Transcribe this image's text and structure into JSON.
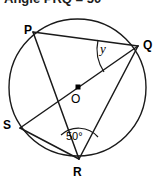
{
  "heading": {
    "text": "Angle PRQ = 50°"
  },
  "figure": {
    "caption_hidden": "Circle with inscribed points P, Q, R, S and centre O",
    "stroke_color": "#1a1a1a",
    "background_color": "#ffffff",
    "circle": {
      "cx": 77.5,
      "cy": 87.5,
      "r": 68.5
    },
    "centre": {
      "label": "O",
      "marker": "square-dot",
      "x": 78,
      "y": 87
    },
    "points": [
      {
        "id": "P",
        "label": "P",
        "x": 33,
        "y": 32
      },
      {
        "id": "Q",
        "label": "Q",
        "x": 138,
        "y": 46
      },
      {
        "id": "S",
        "label": "S",
        "x": 20,
        "y": 128
      },
      {
        "id": "R",
        "label": "R",
        "x": 79,
        "y": 159
      }
    ],
    "chords": [
      {
        "name": "PQ",
        "from": "P",
        "to": "Q"
      },
      {
        "name": "PR",
        "from": "P",
        "to": "R"
      },
      {
        "name": "QR",
        "from": "Q",
        "to": "R"
      },
      {
        "name": "SR",
        "from": "S",
        "to": "R"
      },
      {
        "name": "SQ",
        "from": "S",
        "to": "Q",
        "note": "passes through centre O"
      }
    ],
    "angles": [
      {
        "id": "y",
        "label": "y",
        "vertex": "Q",
        "between": [
          "QP",
          "QR"
        ],
        "arc_marker": true
      },
      {
        "id": "angle-50",
        "label": "50°",
        "value": 50,
        "unit": "degrees",
        "vertex": "R",
        "between": [
          "RS",
          "RQ"
        ],
        "arc_marker": true
      }
    ]
  }
}
